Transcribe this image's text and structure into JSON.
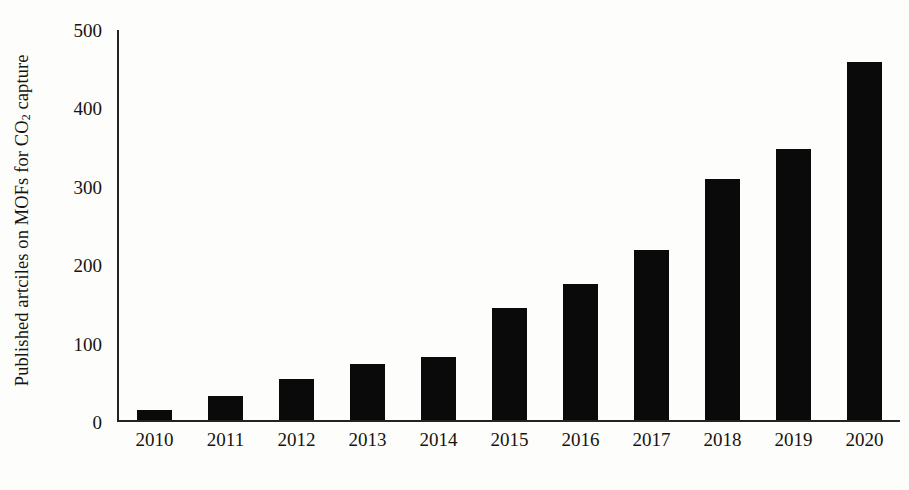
{
  "chart_data": {
    "type": "bar",
    "title": "",
    "xlabel": "",
    "ylabel_parts": {
      "before": "Published artciles on MOFs for CO",
      "sub": "2",
      "after": " capture"
    },
    "ylabel": "Published artciles on MOFs for CO2 capture",
    "categories": [
      "2010",
      "2011",
      "2012",
      "2013",
      "2014",
      "2015",
      "2016",
      "2017",
      "2018",
      "2019",
      "2020"
    ],
    "values": [
      13,
      30,
      52,
      71,
      80,
      143,
      173,
      217,
      308,
      346,
      457
    ],
    "ylim": [
      0,
      500
    ],
    "yticks": [
      0,
      100,
      200,
      300,
      400,
      500
    ],
    "ytick_labels": [
      "0",
      "100",
      "200",
      "300",
      "400",
      "500"
    ],
    "grid": false,
    "legend": "none",
    "bar_color": "#0a0a0a",
    "axis_color": "#232323",
    "background_color": "#fdfdfb"
  }
}
